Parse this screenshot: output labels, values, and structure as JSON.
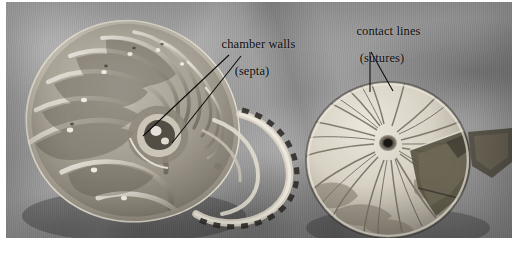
{
  "figure": {
    "kind": "photograph",
    "palette": {
      "background": "#ffffff",
      "cloth_light": "#b4b4b4",
      "cloth_mid": "#9d9d9d",
      "cloth_dark": "#828282",
      "shell_highlight": "#eae6dc",
      "shell_mid": "#b9b3a6",
      "shell_shadow": "#5c564c",
      "stripe_dark": "#2a2722",
      "label_text": "#0d0d0d",
      "leader_line": "#0a0a0a"
    }
  },
  "annotations": [
    {
      "id": "chamber-walls",
      "line1": "chamber walls",
      "line2": "(septa)",
      "leaders": [
        {
          "x1": 229,
          "y1": 55,
          "x2": 143,
          "y2": 136
        },
        {
          "x1": 241,
          "y1": 56,
          "x2": 172,
          "y2": 143
        }
      ]
    },
    {
      "id": "contact-lines",
      "line1": "contact lines",
      "line2": "(sutures)",
      "leaders": [
        {
          "x1": 370,
          "y1": 52,
          "x2": 370,
          "y2": 92
        },
        {
          "x1": 371,
          "y1": 52,
          "x2": 393,
          "y2": 91
        }
      ]
    }
  ],
  "specimens": [
    {
      "id": "sectioned-shell",
      "name": "cut-away nautilus shell",
      "view": "median longitudinal section",
      "features": [
        "logarithmic spiral",
        "chamber walls (septa)",
        "siphuncle",
        "striped outer lip"
      ]
    },
    {
      "id": "whole-shell",
      "name": "whole nautilus shell",
      "view": "apertural / external face",
      "features": [
        "radiating contact lines (sutures)",
        "converging apex",
        "broken aperture margin"
      ]
    }
  ]
}
